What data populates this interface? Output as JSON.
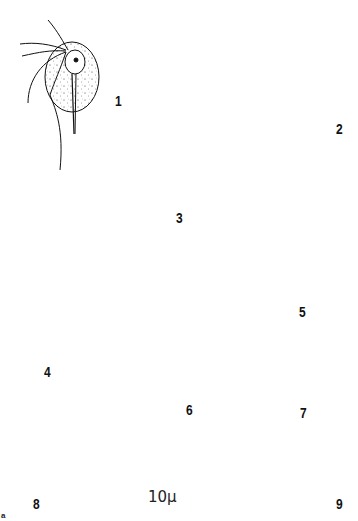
{
  "figure": {
    "type": "scientific-illustration-plate",
    "ink_color": "#111111",
    "background": "#ffffff",
    "panels": [
      {
        "id": "1",
        "label": "1",
        "description": "flagellate trophozoite, oval, stippled, 4 anterior flagella, axostyle, nucleus anterior"
      },
      {
        "id": "2",
        "label": "2",
        "description": "flagellate trophozoite, unstippled outline, long axostyle, undulating membrane"
      },
      {
        "id": "3",
        "label": "3",
        "description": "elongate stippled trophozoite with single flagellum"
      },
      {
        "id": "4",
        "label": "4",
        "description": "double-walled oval cyst with single nucleus"
      },
      {
        "id": "5",
        "label": "5",
        "description": "double-walled oval cyst with nucleus and inner body"
      },
      {
        "id": "6",
        "label": "6",
        "description": "stippled trophozoite with posterior knob, flagella"
      },
      {
        "id": "7",
        "label": "7",
        "description": "elongated cyst with two nuclei"
      },
      {
        "id": "8",
        "label": "8",
        "description": "double-walled round cyst with four nuclei"
      },
      {
        "id": "9",
        "label": "9",
        "description": "round cyst with two nuclei"
      }
    ],
    "scale_bar": {
      "label": "10μ",
      "length_units": 10,
      "unit": "μ"
    },
    "corner_mark": "a"
  }
}
